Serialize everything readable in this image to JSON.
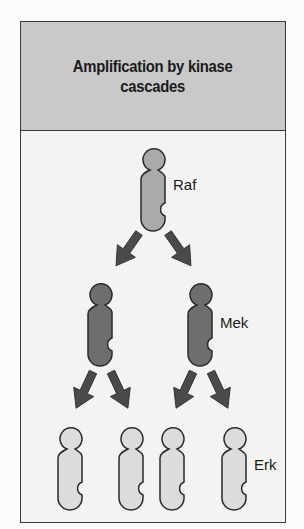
{
  "title": "Amplification by kinase cascades",
  "title_lines": [
    "Amplification by kinase",
    "cascades"
  ],
  "colors": {
    "header_bg": "#c9c9c9",
    "body_bg": "#f3f3f1",
    "raf_fill": "#aaaaaa",
    "mek_fill": "#6e6e6e",
    "erk_fill": "#dcdcdc",
    "arrow_fill": "#4a4a4a",
    "outline": "#2a2a2a"
  },
  "nodes": {
    "raf": {
      "label": "Raf",
      "count": 1
    },
    "mek": {
      "label": "Mek",
      "count": 2
    },
    "erk": {
      "label": "Erk",
      "count": 4
    }
  }
}
